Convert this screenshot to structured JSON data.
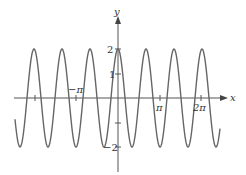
{
  "chart_data": {
    "type": "line",
    "title": "",
    "function": "y = 2cos(3x)",
    "xlabel": "x",
    "ylabel": "y",
    "x_ticks": [
      {
        "value": -3.14159,
        "label": "-π"
      },
      {
        "value": 3.14159,
        "label": "π"
      },
      {
        "value": 6.28318,
        "label": "2π"
      }
    ],
    "y_ticks": [
      {
        "value": 2,
        "label": "2"
      },
      {
        "value": 1,
        "label": "1"
      },
      {
        "value": -1,
        "label": ""
      },
      {
        "value": -2,
        "label": "-2"
      }
    ],
    "xlim": [
      -7.7,
      7.6
    ],
    "ylim": [
      -2.2,
      2.2
    ],
    "amplitude": 2,
    "frequency": 3,
    "series": [
      {
        "name": "2cos(3x)",
        "color": "#555555"
      }
    ],
    "grid": false
  },
  "labels": {
    "x_axis": "x",
    "y_axis": "y",
    "neg_pi": "−π",
    "pi": "π",
    "two_pi": "2π",
    "y2": "2",
    "y1": "1",
    "yneg2": "−2"
  }
}
